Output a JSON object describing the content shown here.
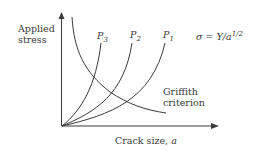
{
  "diagram": {
    "y_axis_label_line1": "Applied",
    "y_axis_label_line2": "stress",
    "x_axis_label_prefix": "Crack size, ",
    "x_axis_label_var": "a",
    "curves": [
      {
        "name": "P",
        "sub": "3"
      },
      {
        "name": "P",
        "sub": "2"
      },
      {
        "name": "P",
        "sub": "1"
      }
    ],
    "equation_lhs": "σ = Y/a",
    "equation_exp": "1/2",
    "griffith_line1": "Griffith",
    "griffith_line2": "criterion",
    "colors": {
      "line": "#3a3a3a",
      "background": "#ffffff"
    }
  }
}
